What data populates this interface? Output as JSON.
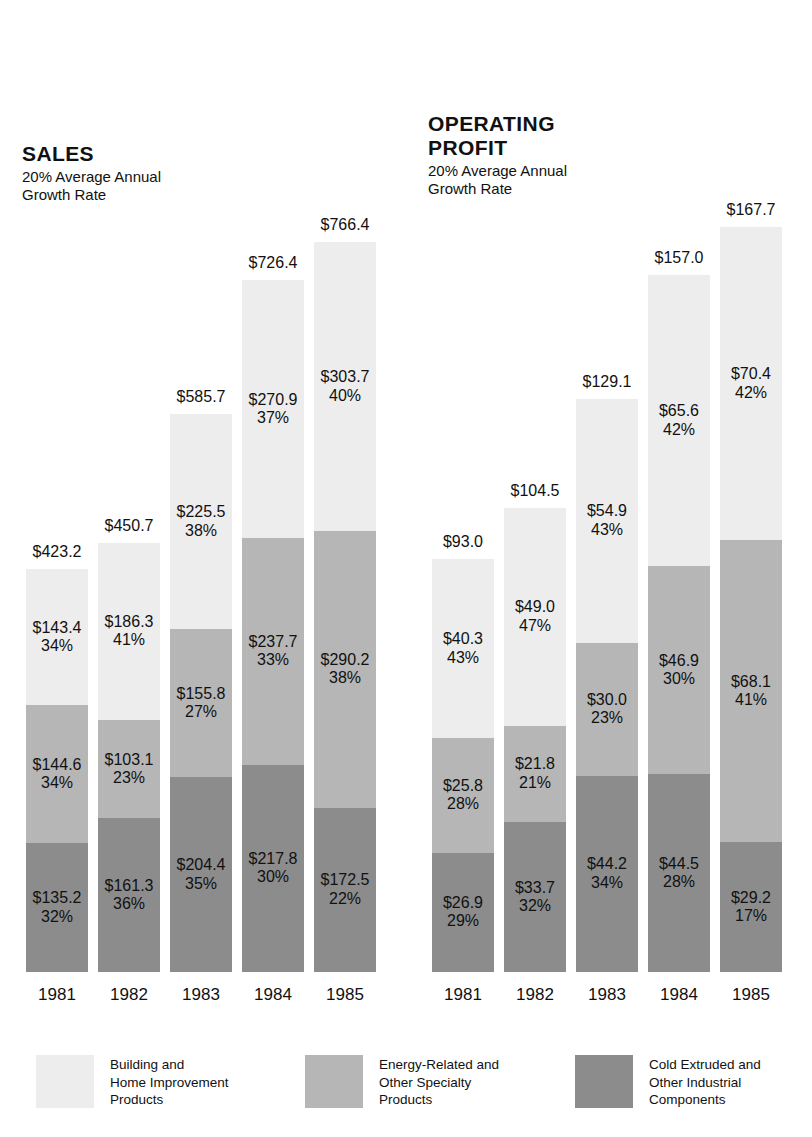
{
  "chart_data": {
    "type": "bar",
    "subtype": "stacked-column",
    "title": "",
    "categories": [
      "1981",
      "1982",
      "1983",
      "1984",
      "1985"
    ],
    "xlabel": "",
    "ylabel": "",
    "grid": false,
    "legend_position": "bottom",
    "series": [
      {
        "name": "Building and Home Improvement Products",
        "color": "#ededed",
        "sales": [
          143.4,
          186.3,
          225.5,
          270.9,
          303.7
        ],
        "sales_pct": [
          "34%",
          "41%",
          "38%",
          "37%",
          "40%"
        ],
        "profit": [
          40.3,
          49.0,
          54.9,
          65.6,
          70.4
        ],
        "profit_pct": [
          "43%",
          "47%",
          "43%",
          "42%",
          "42%"
        ]
      },
      {
        "name": "Energy-Related and Other Specialty Products",
        "color": "#b6b6b6",
        "sales": [
          144.6,
          103.1,
          155.8,
          237.7,
          290.2
        ],
        "sales_pct": [
          "34%",
          "23%",
          "27%",
          "33%",
          "38%"
        ],
        "profit": [
          25.8,
          21.8,
          30.0,
          46.9,
          68.1
        ],
        "profit_pct": [
          "28%",
          "21%",
          "23%",
          "30%",
          "41%"
        ]
      },
      {
        "name": "Cold Extruded and Other Industrial Components",
        "color": "#8c8c8c",
        "sales": [
          135.2,
          161.3,
          204.4,
          217.8,
          172.5
        ],
        "sales_pct": [
          "32%",
          "36%",
          "35%",
          "30%",
          "22%"
        ],
        "profit": [
          26.9,
          33.7,
          44.2,
          44.5,
          29.2
        ],
        "profit_pct": [
          "29%",
          "32%",
          "34%",
          "28%",
          "17%"
        ]
      }
    ],
    "sales_totals": [
      423.2,
      450.7,
      585.7,
      726.4,
      766.4
    ],
    "profit_totals": [
      93.0,
      104.5,
      129.1,
      157.0,
      167.7
    ]
  },
  "panels": [
    {
      "id": "sales",
      "title_main": "SALES",
      "title_sub": "20% Average Annual\nGrowth Rate",
      "groups": [
        {
          "year": "1981",
          "total": "$423.2",
          "segments": [
            {
              "value": "$143.4",
              "pct": "34%",
              "tone": "light"
            },
            {
              "value": "$144.6",
              "pct": "34%",
              "tone": "mid"
            },
            {
              "value": "$135.2",
              "pct": "32%",
              "tone": "dark"
            }
          ]
        },
        {
          "year": "1982",
          "total": "$450.7",
          "segments": [
            {
              "value": "$186.3",
              "pct": "41%",
              "tone": "light"
            },
            {
              "value": "$103.1",
              "pct": "23%",
              "tone": "mid"
            },
            {
              "value": "$161.3",
              "pct": "36%",
              "tone": "dark"
            }
          ]
        },
        {
          "year": "1983",
          "total": "$585.7",
          "segments": [
            {
              "value": "$225.5",
              "pct": "38%",
              "tone": "light"
            },
            {
              "value": "$155.8",
              "pct": "27%",
              "tone": "mid"
            },
            {
              "value": "$204.4",
              "pct": "35%",
              "tone": "dark"
            }
          ]
        },
        {
          "year": "1984",
          "total": "$726.4",
          "segments": [
            {
              "value": "$270.9",
              "pct": "37%",
              "tone": "light"
            },
            {
              "value": "$237.7",
              "pct": "33%",
              "tone": "mid"
            },
            {
              "value": "$217.8",
              "pct": "30%",
              "tone": "dark"
            }
          ]
        },
        {
          "year": "1985",
          "total": "$766.4",
          "segments": [
            {
              "value": "$303.7",
              "pct": "40%",
              "tone": "light"
            },
            {
              "value": "$290.2",
              "pct": "38%",
              "tone": "mid"
            },
            {
              "value": "$172.5",
              "pct": "22%",
              "tone": "dark"
            }
          ]
        }
      ]
    },
    {
      "id": "profit",
      "title_main": "OPERATING\nPROFIT",
      "title_sub": "20% Average Annual\nGrowth Rate",
      "groups": [
        {
          "year": "1981",
          "total": "$93.0",
          "segments": [
            {
              "value": "$40.3",
              "pct": "43%",
              "tone": "light"
            },
            {
              "value": "$25.8",
              "pct": "28%",
              "tone": "mid"
            },
            {
              "value": "$26.9",
              "pct": "29%",
              "tone": "dark"
            }
          ]
        },
        {
          "year": "1982",
          "total": "$104.5",
          "segments": [
            {
              "value": "$49.0",
              "pct": "47%",
              "tone": "light"
            },
            {
              "value": "$21.8",
              "pct": "21%",
              "tone": "mid"
            },
            {
              "value": "$33.7",
              "pct": "32%",
              "tone": "dark"
            }
          ]
        },
        {
          "year": "1983",
          "total": "$129.1",
          "segments": [
            {
              "value": "$54.9",
              "pct": "43%",
              "tone": "light"
            },
            {
              "value": "$30.0",
              "pct": "23%",
              "tone": "mid"
            },
            {
              "value": "$44.2",
              "pct": "34%",
              "tone": "dark"
            }
          ]
        },
        {
          "year": "1984",
          "total": "$157.0",
          "segments": [
            {
              "value": "$65.6",
              "pct": "42%",
              "tone": "light"
            },
            {
              "value": "$46.9",
              "pct": "30%",
              "tone": "mid"
            },
            {
              "value": "$44.5",
              "pct": "28%",
              "tone": "dark"
            }
          ]
        },
        {
          "year": "1985",
          "total": "$167.7",
          "segments": [
            {
              "value": "$70.4",
              "pct": "42%",
              "tone": "light"
            },
            {
              "value": "$68.1",
              "pct": "41%",
              "tone": "mid"
            },
            {
              "value": "$29.2",
              "pct": "17%",
              "tone": "dark"
            }
          ]
        }
      ]
    }
  ],
  "legend": [
    {
      "label": "Building and\nHome Improvement\nProducts",
      "color": "#ededed"
    },
    {
      "label": "Energy-Related and\nOther Specialty\nProducts",
      "color": "#b6b6b6"
    },
    {
      "label": "Cold Extruded and\nOther Industrial\nComponents",
      "color": "#8c8c8c"
    }
  ],
  "colors": {
    "light": "#ededed",
    "mid": "#b6b6b6",
    "dark": "#8c8c8c",
    "text": "#111111",
    "background": "#ffffff"
  }
}
